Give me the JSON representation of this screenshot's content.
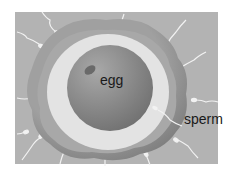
{
  "diagram": {
    "labels": {
      "egg": "egg",
      "sperm": "sperm"
    },
    "colors": {
      "background": "#b3b3b3",
      "outer_layer": "#8c8c8c",
      "outer_layer_inner": "#a6a6a6",
      "clear_zone": "#e2e2e2",
      "egg": "#8a8a8a",
      "nucleus": "#6f6f6f",
      "sperm": "#f2f2f2"
    }
  }
}
